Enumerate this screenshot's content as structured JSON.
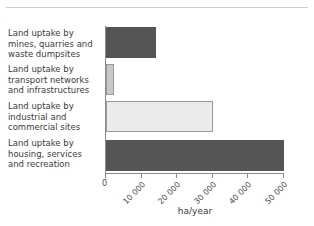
{
  "chart_data": {
    "type": "bar",
    "orientation": "horizontal",
    "title": "",
    "xlabel": "ha/year",
    "ylabel": "",
    "xlim": [
      0,
      50400
    ],
    "grid": false,
    "legend": false,
    "categories": [
      "Land uptake by mines, quarries and waste dumpsites",
      "Land uptake by transport networks and infrastructures",
      "Land uptake by industrial and commercial sites",
      "Land uptake by housing, services and recreation"
    ],
    "values": [
      14000,
      2200,
      30000,
      50000
    ],
    "tick_values": [
      0,
      10000,
      20000,
      30000,
      40000,
      50000
    ],
    "tick_labels": [
      "0",
      "10 000",
      "20 000",
      "30 000",
      "40 000",
      "50 000"
    ],
    "bar_colors": [
      "#555555",
      "#c8c8c8",
      "#ebebeb",
      "#555555"
    ]
  },
  "labels": {
    "cat0_line1": "Land uptake by",
    "cat0_line2": "mines, quarries and",
    "cat0_line3": "waste dumpsites",
    "cat1_line1": "Land uptake by",
    "cat1_line2": "transport networks",
    "cat1_line3": "and infrastructures",
    "cat2_line1": "Land uptake by",
    "cat2_line2": "industrial and",
    "cat2_line3": "commercial sites",
    "cat3_line1": "Land uptake by",
    "cat3_line2": "housing, services",
    "cat3_line3": "and recreation"
  },
  "axis": {
    "x_label": "ha/year",
    "tick0": "0",
    "tick1": "10 000",
    "tick2": "20 000",
    "tick3": "30 000",
    "tick4": "40 000",
    "tick5": "50 000"
  }
}
